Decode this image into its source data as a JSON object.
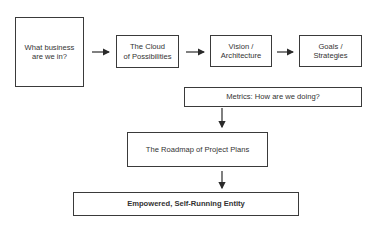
{
  "diagram": {
    "type": "flowchart",
    "colors": {
      "line": "#3a3a3a",
      "text": "#333333",
      "background": "#ffffff"
    },
    "nodes": [
      {
        "id": "business",
        "line1": "What business",
        "line2": "are we in?"
      },
      {
        "id": "cloud",
        "line1": "The Cloud",
        "line2": "of Possibilities"
      },
      {
        "id": "vision",
        "line1": "Vision /",
        "line2": "Architecture"
      },
      {
        "id": "goals",
        "line1": "Goals /",
        "line2": "Strategies"
      },
      {
        "id": "metrics",
        "label": "Metrics: How are we doing?"
      },
      {
        "id": "roadmap",
        "label": "The Roadmap of Project Plans"
      },
      {
        "id": "entity",
        "label": "Empowered, Self-Running Entity"
      }
    ],
    "edges": [
      {
        "from": "business",
        "to": "cloud"
      },
      {
        "from": "cloud",
        "to": "vision"
      },
      {
        "from": "vision",
        "to": "goals"
      },
      {
        "from": "metrics",
        "to": "roadmap"
      },
      {
        "from": "roadmap",
        "to": "entity"
      }
    ]
  }
}
